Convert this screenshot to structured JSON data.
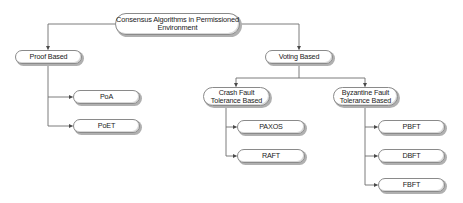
{
  "diagram": {
    "type": "tree",
    "colors": {
      "line": "#6e6e6e",
      "node_border": "#8a8a8a",
      "node_fill": "#ffffff",
      "text": "#1a1a1a"
    },
    "root": {
      "id": "root",
      "label_line1": "Consensus Algorithms in Permissioned",
      "label_line2": "Environment"
    },
    "nodes": {
      "proof": {
        "label": "Proof Based"
      },
      "poa": {
        "label": "PoA"
      },
      "poet": {
        "label": "PoET"
      },
      "voting": {
        "label": "Voting Based"
      },
      "crash": {
        "label_line1": "Crash Fault",
        "label_line2": "Tolerance Based"
      },
      "byzantine": {
        "label_line1": "Byzantine Fault",
        "label_line2": "Tolerance Based"
      },
      "paxos": {
        "label": "PAXOS"
      },
      "raft": {
        "label": "RAFT"
      },
      "pbft": {
        "label": "PBFT"
      },
      "dbft": {
        "label": "DBFT"
      },
      "fbft": {
        "label": "FBFT"
      }
    },
    "edges": [
      [
        "root",
        "proof"
      ],
      [
        "root",
        "voting"
      ],
      [
        "proof",
        "poa"
      ],
      [
        "proof",
        "poet"
      ],
      [
        "voting",
        "crash"
      ],
      [
        "voting",
        "byzantine"
      ],
      [
        "crash",
        "paxos"
      ],
      [
        "crash",
        "raft"
      ],
      [
        "byzantine",
        "pbft"
      ],
      [
        "byzantine",
        "dbft"
      ],
      [
        "byzantine",
        "fbft"
      ]
    ]
  }
}
